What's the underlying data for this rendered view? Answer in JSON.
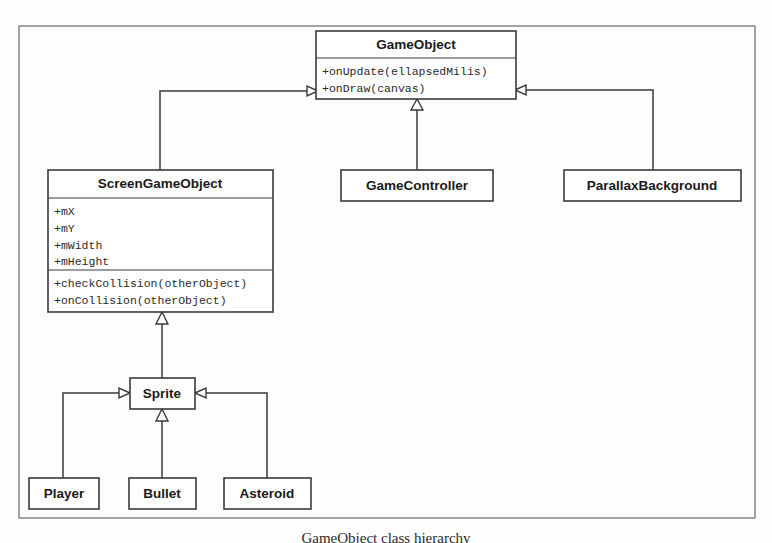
{
  "diagram": {
    "type": "uml-class-diagram",
    "caption": "GameObject class hierarchy",
    "frame_color": "#8d8d8d",
    "line_color": "#3a3a3a",
    "box_fill": "#ffffff",
    "classes": [
      {
        "id": "game-object",
        "name": "GameObject",
        "attributes": [],
        "methods": [
          "+onUpdate(ellapsedMilis)",
          "+onDraw(canvas)"
        ]
      },
      {
        "id": "screen-game-object",
        "name": "ScreenGameObject",
        "attributes": [
          "+mX",
          "+mY",
          "+mWidth",
          "+mHeight"
        ],
        "methods": [
          "+checkCollision(otherObject)",
          "+onCollision(otherObject)"
        ]
      },
      {
        "id": "game-controller",
        "name": "GameController",
        "attributes": [],
        "methods": []
      },
      {
        "id": "parallax-background",
        "name": "ParallaxBackground",
        "attributes": [],
        "methods": []
      },
      {
        "id": "sprite",
        "name": "Sprite",
        "attributes": [],
        "methods": []
      },
      {
        "id": "player",
        "name": "Player",
        "attributes": [],
        "methods": []
      },
      {
        "id": "bullet",
        "name": "Bullet",
        "attributes": [],
        "methods": []
      },
      {
        "id": "asteroid",
        "name": "Asteroid",
        "attributes": [],
        "methods": []
      }
    ],
    "relationships": [
      {
        "from": "screen-game-object",
        "to": "game-object",
        "kind": "generalization"
      },
      {
        "from": "game-controller",
        "to": "game-object",
        "kind": "generalization"
      },
      {
        "from": "parallax-background",
        "to": "game-object",
        "kind": "generalization"
      },
      {
        "from": "sprite",
        "to": "screen-game-object",
        "kind": "generalization"
      },
      {
        "from": "player",
        "to": "sprite",
        "kind": "generalization"
      },
      {
        "from": "bullet",
        "to": "sprite",
        "kind": "generalization"
      },
      {
        "from": "asteroid",
        "to": "sprite",
        "kind": "generalization"
      }
    ]
  }
}
